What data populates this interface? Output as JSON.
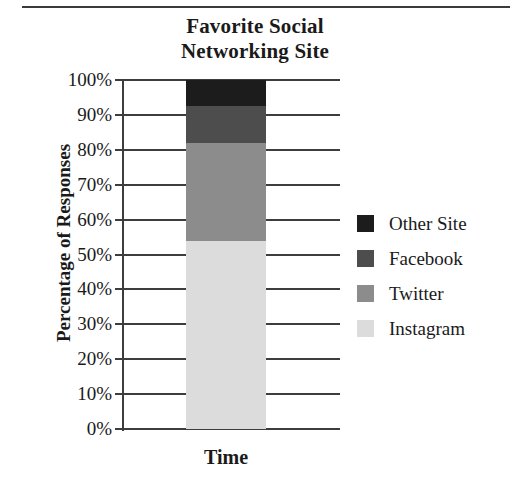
{
  "chart_data": {
    "type": "bar",
    "title": "Favorite Social Networking Site",
    "title_lines": [
      "Favorite Social",
      "Networking Site"
    ],
    "xlabel": "Time",
    "ylabel": "Percentage of Responses",
    "stacked": true,
    "grid": true,
    "legend_position": "right",
    "categories": [
      "Time"
    ],
    "ylim": [
      0,
      100
    ],
    "ytick_labels": [
      "100%",
      "90%",
      "80%",
      "70%",
      "60%",
      "50%",
      "40%",
      "30%",
      "20%",
      "10%",
      "0%"
    ],
    "ytick_values": [
      100,
      90,
      80,
      70,
      60,
      50,
      40,
      30,
      20,
      10,
      0
    ],
    "series": [
      {
        "name": "Other Site",
        "values": [
          7.5
        ],
        "color": "#1c1c1c",
        "range": [
          92.5,
          100
        ]
      },
      {
        "name": "Facebook",
        "values": [
          10.5
        ],
        "color": "#4d4d4d",
        "range": [
          82,
          92.5
        ]
      },
      {
        "name": "Twitter",
        "values": [
          28
        ],
        "color": "#8c8c8c",
        "range": [
          54,
          82
        ]
      },
      {
        "name": "Instagram",
        "values": [
          54
        ],
        "color": "#dcdcdc",
        "range": [
          0,
          54
        ]
      }
    ],
    "legend_entries": [
      {
        "label": "Other Site",
        "color": "#1c1c1c"
      },
      {
        "label": "Facebook",
        "color": "#4d4d4d"
      },
      {
        "label": "Twitter",
        "color": "#8c8c8c"
      },
      {
        "label": "Instagram",
        "color": "#dcdcdc"
      }
    ]
  }
}
